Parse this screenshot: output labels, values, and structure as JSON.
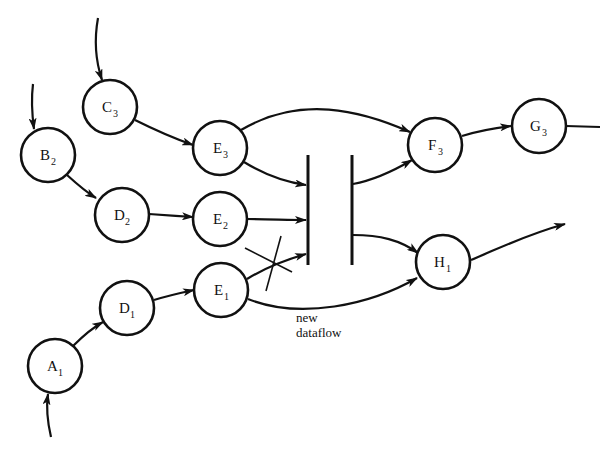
{
  "diagram": {
    "type": "dataflow-graph",
    "nodes": [
      {
        "id": "C3",
        "letter": "C",
        "sub": "3",
        "x": 110,
        "y": 107
      },
      {
        "id": "B2",
        "letter": "B",
        "sub": "2",
        "x": 48,
        "y": 155
      },
      {
        "id": "E3",
        "letter": "E",
        "sub": "3",
        "x": 220,
        "y": 148
      },
      {
        "id": "D2",
        "letter": "D",
        "sub": "2",
        "x": 122,
        "y": 215
      },
      {
        "id": "E2",
        "letter": "E",
        "sub": "2",
        "x": 220,
        "y": 219
      },
      {
        "id": "E1",
        "letter": "E",
        "sub": "1",
        "x": 221,
        "y": 290
      },
      {
        "id": "D1",
        "letter": "D",
        "sub": "1",
        "x": 127,
        "y": 308
      },
      {
        "id": "A1",
        "letter": "A",
        "sub": "1",
        "x": 55,
        "y": 366
      },
      {
        "id": "F3",
        "letter": "F",
        "sub": "3",
        "x": 435,
        "y": 145
      },
      {
        "id": "G3",
        "letter": "G",
        "sub": "3",
        "x": 539,
        "y": 126
      },
      {
        "id": "H1",
        "letter": "H",
        "sub": "1",
        "x": 443,
        "y": 262
      }
    ],
    "edges": [
      {
        "from": "input",
        "to": "C3"
      },
      {
        "from": "input",
        "to": "B2"
      },
      {
        "from": "input",
        "to": "A1"
      },
      {
        "from": "C3",
        "to": "E3"
      },
      {
        "from": "B2",
        "to": "D2"
      },
      {
        "from": "D2",
        "to": "E2"
      },
      {
        "from": "A1",
        "to": "D1"
      },
      {
        "from": "D1",
        "to": "E1"
      },
      {
        "from": "E3",
        "to": "F3"
      },
      {
        "from": "E3",
        "to": "store"
      },
      {
        "from": "E2",
        "to": "store"
      },
      {
        "from": "E1",
        "to": "store",
        "removed": true
      },
      {
        "from": "store",
        "to": "F3"
      },
      {
        "from": "store",
        "to": "H1"
      },
      {
        "from": "E1",
        "to": "H1",
        "label": "new dataflow"
      },
      {
        "from": "F3",
        "to": "G3"
      },
      {
        "from": "G3",
        "to": "output"
      },
      {
        "from": "H1",
        "to": "output"
      }
    ],
    "store": {
      "shape": "two parallel vertical bars"
    },
    "annotation": {
      "line1": "new",
      "line2": "dataflow"
    }
  },
  "labels": {
    "C3": {
      "letter": "C",
      "sub": "3"
    },
    "B2": {
      "letter": "B",
      "sub": "2"
    },
    "E3": {
      "letter": "E",
      "sub": "3"
    },
    "D2": {
      "letter": "D",
      "sub": "2"
    },
    "E2": {
      "letter": "E",
      "sub": "2"
    },
    "E1": {
      "letter": "E",
      "sub": "1"
    },
    "D1": {
      "letter": "D",
      "sub": "1"
    },
    "A1": {
      "letter": "A",
      "sub": "1"
    },
    "F3": {
      "letter": "F",
      "sub": "3"
    },
    "G3": {
      "letter": "G",
      "sub": "3"
    },
    "H1": {
      "letter": "H",
      "sub": "1"
    }
  },
  "annotation": {
    "line1": "new",
    "line2": "dataflow"
  }
}
